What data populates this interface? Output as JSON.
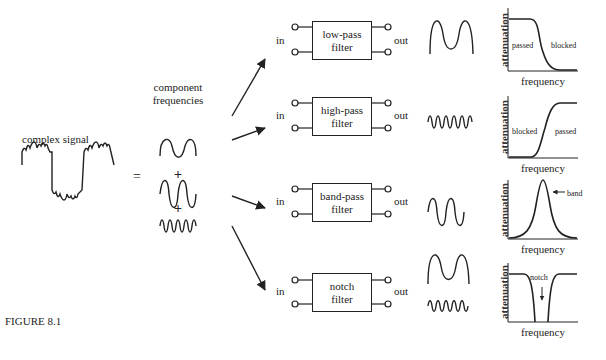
{
  "figure_label": "FIGURE 8.1",
  "input": {
    "label": "complex signal",
    "equals": "=",
    "components_label_line1": "component",
    "components_label_line2": "frequencies",
    "plus": "+"
  },
  "filters": [
    {
      "name_line1": "low-pass",
      "name_line2": "filter",
      "in": "in",
      "out": "out",
      "graph": {
        "ylabel": "attenuation",
        "xlabel": "frequency",
        "left_label": "passed",
        "right_label": "blocked"
      }
    },
    {
      "name_line1": "high-pass",
      "name_line2": "filter",
      "in": "in",
      "out": "out",
      "graph": {
        "ylabel": "attenuation",
        "xlabel": "frequency",
        "left_label": "blocked",
        "right_label": "passed"
      }
    },
    {
      "name_line1": "band-pass",
      "name_line2": "filter",
      "in": "in",
      "out": "out",
      "graph": {
        "ylabel": "attenuation",
        "xlabel": "frequency",
        "annotation": "band"
      }
    },
    {
      "name_line1": "notch",
      "name_line2": "filter",
      "in": "in",
      "out": "out",
      "graph": {
        "ylabel": "attenuation",
        "xlabel": "frequency",
        "annotation": "notch"
      }
    }
  ]
}
